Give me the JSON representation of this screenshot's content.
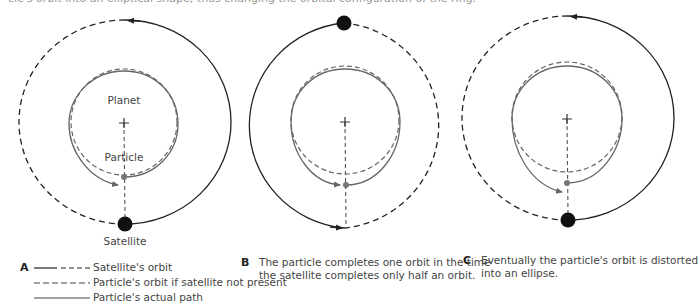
{
  "top_caption": "cle's orbit into an elliptical shape, thus changing the orbital configuration of the ring.",
  "colors": {
    "satellite_orbit": "#222222",
    "particle_path": "#666666",
    "particle_orbit_unperturbed": "#666666",
    "satellite_fill": "#111111",
    "particle_fill": "#777777",
    "text": "#444444"
  },
  "panels": [
    {
      "id": "A",
      "letter": "A",
      "labels": {
        "planet": "Planet",
        "particle": "Particle",
        "satellite": "Satellite"
      },
      "legend": [
        {
          "style": "long-dash-then-short",
          "label": "Satellite's orbit"
        },
        {
          "style": "dashed",
          "label": "Particle's orbit if satellite not present"
        },
        {
          "style": "solid",
          "label": "Particle's actual path"
        }
      ]
    },
    {
      "id": "B",
      "letter": "B",
      "caption_lines": [
        "The particle completes one orbit in the time",
        "the satellite completes only half an orbit."
      ]
    },
    {
      "id": "C",
      "letter": "C",
      "caption_lines": [
        "Eventually the particle's orbit is distorted",
        "into an ellipse."
      ]
    }
  ]
}
